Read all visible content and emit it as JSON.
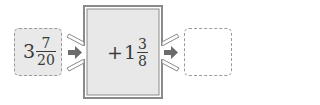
{
  "diagram": {
    "type": "function-machine",
    "input": {
      "whole": "3",
      "numerator": "7",
      "denominator": "20"
    },
    "operation": {
      "sign": "+",
      "whole": "1",
      "numerator": "3",
      "denominator": "8"
    },
    "output": {
      "value": ""
    },
    "icons": {
      "arrow_in": "right-arrow",
      "arrow_out": "right-arrow"
    },
    "colors": {
      "box_fill": "#e9e9e9",
      "machine_fill": "#e8e8e8",
      "border": "#8a8a8a",
      "arrow": "#6b6b6b"
    }
  }
}
